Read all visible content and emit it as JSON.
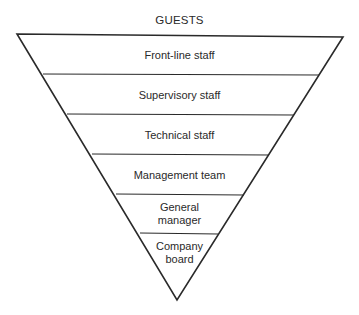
{
  "diagram": {
    "type": "inverted-pyramid",
    "title": "GUESTS",
    "colors": {
      "stroke": "#2a2a2a",
      "background": "#ffffff",
      "text": "#2a2a2a"
    },
    "tiers": [
      {
        "label": "Front-line staff"
      },
      {
        "label": "Supervisory staff"
      },
      {
        "label": "Technical staff"
      },
      {
        "label": "Management team"
      },
      {
        "label": "General manager",
        "line1": "General",
        "line2": "manager"
      },
      {
        "label": "Company board",
        "line1": "Company",
        "line2": "board"
      }
    ]
  }
}
